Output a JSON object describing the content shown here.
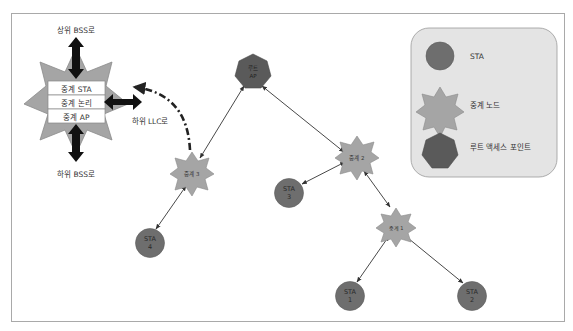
{
  "colors": {
    "background": "#ffffff",
    "frame": "#a9a9a9",
    "sta_fill": "#6e6e6e",
    "sta_stroke": "#5c5c5c",
    "relay_fill": "#a5a5a5",
    "relay_stroke": "#8a8a8a",
    "root_fill": "#5a5a5a",
    "legend_fill": "#e4e4e4",
    "legend_stroke": "#9a9a9a",
    "arrow": "#333333",
    "thick_arrow": "#111111",
    "node_text": "#2a2a2a",
    "label_text": "#333333"
  },
  "relay_detail": {
    "up_label": "상위 BSS로",
    "down_label": "하위 BSS로",
    "llc_label": "하위 LLC로",
    "layers": [
      "중계 STA",
      "중계 논리",
      "중계 AP"
    ]
  },
  "legend": {
    "items": [
      {
        "shape": "circle",
        "label": "STA"
      },
      {
        "shape": "star",
        "label": "중계 노드"
      },
      {
        "shape": "heptagon",
        "label": "루트 액세스 포인트"
      }
    ]
  },
  "nodes": {
    "root": {
      "line1": "루트",
      "line2": "AP"
    },
    "relay1": {
      "label": "중계 1"
    },
    "relay2": {
      "label": "중계 2"
    },
    "relay3": {
      "label": "중계 3"
    },
    "sta1": {
      "line1": "STA",
      "line2": "1"
    },
    "sta2": {
      "line1": "STA",
      "line2": "2"
    },
    "sta3": {
      "line1": "STA",
      "line2": "3"
    },
    "sta4": {
      "line1": "STA",
      "line2": "4"
    }
  },
  "links": [
    [
      "root",
      "relay3"
    ],
    [
      "root",
      "relay2"
    ],
    [
      "relay3",
      "sta4"
    ],
    [
      "relay2",
      "sta3"
    ],
    [
      "relay2",
      "relay1"
    ],
    [
      "relay1",
      "sta1"
    ],
    [
      "relay1",
      "sta2"
    ]
  ]
}
